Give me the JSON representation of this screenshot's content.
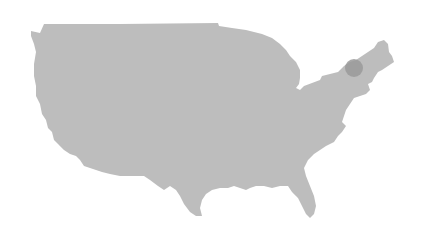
{
  "map": {
    "region": "United States (contiguous)",
    "land_color": "#bdbdbd",
    "background_color": "#ffffff",
    "markers": [
      {
        "location": "Northeast (Vermont / New Hampshire area)",
        "cx": 354,
        "cy": 68,
        "r": 9,
        "color": "#9a9a9a"
      }
    ]
  }
}
